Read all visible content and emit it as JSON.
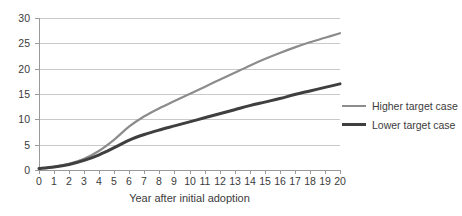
{
  "chart_data": {
    "type": "line",
    "title": "",
    "subtitle": "",
    "xlabel": "Year after initial adoption",
    "ylabel": "",
    "xlim": [
      0,
      20
    ],
    "ylim": [
      0,
      30
    ],
    "grid": true,
    "legend_position": "right",
    "x": [
      0,
      1,
      2,
      3,
      4,
      5,
      6,
      7,
      8,
      9,
      10,
      11,
      12,
      13,
      14,
      15,
      16,
      17,
      18,
      19,
      20
    ],
    "xticks": [
      "0",
      "1",
      "2",
      "3",
      "4",
      "5",
      "6",
      "7",
      "8",
      "9",
      "10",
      "11",
      "12",
      "13",
      "14",
      "15",
      "16",
      "17",
      "18",
      "19",
      "20"
    ],
    "yticks": [
      "0",
      "5",
      "10",
      "15",
      "20",
      "25",
      "30"
    ],
    "ytick_values": [
      0,
      5,
      10,
      15,
      20,
      25,
      30
    ],
    "series": [
      {
        "name": "Higher target case",
        "color": "#8c8c8c",
        "values": [
          0.3,
          0.6,
          1.2,
          2.2,
          3.8,
          6.0,
          8.6,
          10.6,
          12.2,
          13.6,
          15.0,
          16.4,
          17.8,
          19.2,
          20.6,
          21.9,
          23.1,
          24.2,
          25.2,
          26.1,
          27.0
        ]
      },
      {
        "name": "Lower target case",
        "color": "#3f3f3f",
        "values": [
          0.3,
          0.6,
          1.1,
          1.9,
          3.0,
          4.4,
          5.9,
          7.0,
          7.9,
          8.7,
          9.5,
          10.3,
          11.1,
          11.9,
          12.7,
          13.4,
          14.1,
          14.9,
          15.6,
          16.3,
          17.0
        ]
      }
    ]
  },
  "legend": {
    "items": [
      {
        "label": "Higher target case",
        "color": "#8c8c8c",
        "width": 2.2
      },
      {
        "label": "Lower target case",
        "color": "#3f3f3f",
        "width": 3.0
      }
    ]
  }
}
